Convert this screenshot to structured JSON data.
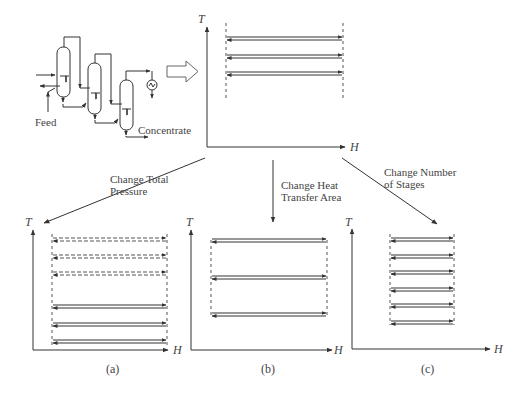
{
  "flowsheet": {
    "feed_label": "Feed",
    "product_label": "Concentrate",
    "columns": 3
  },
  "top_chart": {
    "y_axis": "T",
    "x_axis": "H",
    "arrow_rows": 3
  },
  "transitions": [
    {
      "line1": "Change Total",
      "line2": "Pressure"
    },
    {
      "line1": "Change Heat",
      "line2": "Transfer Area"
    },
    {
      "line1": "Change Number",
      "line2": "of Stages"
    }
  ],
  "panels": [
    {
      "caption": "(a)",
      "y_axis": "T",
      "x_axis": "H",
      "description": "Dashed arrows shifted up; solid arrows at original level"
    },
    {
      "caption": "(b)",
      "y_axis": "T",
      "x_axis": "H",
      "description": "Three arrows spaced further apart"
    },
    {
      "caption": "(c)",
      "y_axis": "T",
      "x_axis": "H",
      "description": "Six shorter arrows"
    }
  ],
  "colors": {
    "line": "#333333",
    "dash": "#555555",
    "hollow_arrow": "#666666"
  }
}
